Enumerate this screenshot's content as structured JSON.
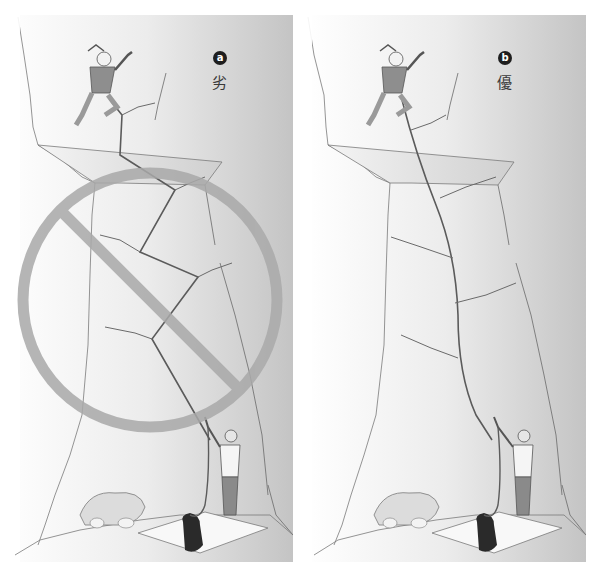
{
  "figure": {
    "panels": [
      {
        "id": "a",
        "badge": "a",
        "verdict": "劣",
        "description": "Bad: rope zig-zags through widely offset protection, creating rope drag",
        "prohibited": true,
        "prohibition_color": "#a9a9a9"
      },
      {
        "id": "b",
        "badge": "b",
        "verdict": "優",
        "description": "Good: slings extend protection so rope runs in a straight line",
        "prohibited": false
      }
    ],
    "colors": {
      "wall_light": "#fdfdfd",
      "wall_dark": "#c9c9c9",
      "line": "#6a6a6a",
      "rope": "#5b5b5b",
      "badge": "#1e1e1e"
    }
  }
}
